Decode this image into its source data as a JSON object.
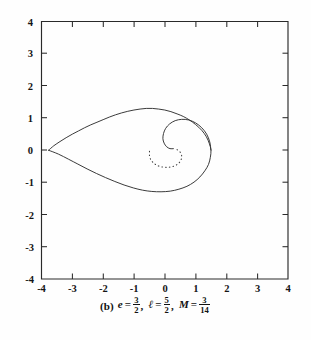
{
  "figure": {
    "panel_label": "(b)",
    "caption_terms": [
      {
        "symbol": "e",
        "relation": "=",
        "numerator": "3",
        "denominator": "2"
      },
      {
        "symbol": "ℓ",
        "relation": "=",
        "numerator": "5",
        "denominator": "2"
      },
      {
        "symbol": "M",
        "relation": "=",
        "numerator": "3",
        "denominator": "14"
      }
    ],
    "caption_plain": "(b) e = 3/2, ℓ = 5/2, M = 3/14",
    "separator": ","
  },
  "chart_data": {
    "type": "line",
    "title": "",
    "subtitle": "",
    "xlabel": "",
    "ylabel": "",
    "xlim": [
      -4,
      4
    ],
    "ylim": [
      -4,
      4
    ],
    "grid": false,
    "legend": null,
    "legend_position": "none",
    "x_ticks": [
      -4,
      -3,
      -2,
      -1,
      0,
      1,
      2,
      3,
      4
    ],
    "x_tick_labels": [
      "-4",
      "-3",
      "-2",
      "-1",
      "0",
      "1",
      "2",
      "3",
      "4"
    ],
    "y_ticks": [
      -4,
      -3,
      -2,
      -1,
      0,
      1,
      2,
      3,
      4
    ],
    "y_tick_labels": [
      "-4",
      "-3",
      "-2",
      "-1",
      "0",
      "1",
      "2",
      "3",
      "4"
    ],
    "series": [
      {
        "name": "orbit-solid",
        "style": "solid",
        "color": "#303030",
        "description": "Teardrop-shaped relativistic orbit with self-intersection near x = -3.75, y = 0, spiralling inward clockwise toward the centre near x = 0.1, y = 0.05",
        "points": [
          [
            -3.77,
            0.0
          ],
          [
            -3.6,
            0.14
          ],
          [
            -3.4,
            0.27
          ],
          [
            -3.2,
            0.39
          ],
          [
            -3.0,
            0.5
          ],
          [
            -2.8,
            0.6
          ],
          [
            -2.6,
            0.7
          ],
          [
            -2.4,
            0.79
          ],
          [
            -2.2,
            0.87
          ],
          [
            -2.0,
            0.95
          ],
          [
            -1.8,
            1.03
          ],
          [
            -1.6,
            1.1
          ],
          [
            -1.4,
            1.16
          ],
          [
            -1.2,
            1.21
          ],
          [
            -1.0,
            1.25
          ],
          [
            -0.8,
            1.28
          ],
          [
            -0.6,
            1.3
          ],
          [
            -0.4,
            1.3
          ],
          [
            -0.2,
            1.28
          ],
          [
            0.0,
            1.25
          ],
          [
            0.2,
            1.2
          ],
          [
            0.4,
            1.13
          ],
          [
            0.6,
            1.05
          ],
          [
            0.8,
            0.94
          ],
          [
            1.0,
            0.8
          ],
          [
            1.2,
            0.62
          ],
          [
            1.35,
            0.42
          ],
          [
            1.45,
            0.2
          ],
          [
            1.5,
            0.0
          ],
          [
            1.48,
            -0.22
          ],
          [
            1.42,
            -0.44
          ],
          [
            1.3,
            -0.64
          ],
          [
            1.14,
            -0.83
          ],
          [
            0.95,
            -0.99
          ],
          [
            0.72,
            -1.12
          ],
          [
            0.46,
            -1.21
          ],
          [
            0.18,
            -1.27
          ],
          [
            -0.12,
            -1.29
          ],
          [
            -0.42,
            -1.28
          ],
          [
            -0.72,
            -1.24
          ],
          [
            -1.02,
            -1.17
          ],
          [
            -1.32,
            -1.08
          ],
          [
            -1.62,
            -0.97
          ],
          [
            -1.92,
            -0.85
          ],
          [
            -2.22,
            -0.72
          ],
          [
            -2.52,
            -0.58
          ],
          [
            -2.82,
            -0.43
          ],
          [
            -3.12,
            -0.28
          ],
          [
            -3.45,
            -0.12
          ],
          [
            -3.77,
            0.0
          ]
        ],
        "spiral_points": [
          [
            1.5,
            0.0
          ],
          [
            1.46,
            0.26
          ],
          [
            1.36,
            0.5
          ],
          [
            1.2,
            0.7
          ],
          [
            1.0,
            0.85
          ],
          [
            0.78,
            0.94
          ],
          [
            0.55,
            0.96
          ],
          [
            0.34,
            0.92
          ],
          [
            0.16,
            0.82
          ],
          [
            0.03,
            0.68
          ],
          [
            -0.04,
            0.52
          ],
          [
            -0.06,
            0.36
          ],
          [
            -0.02,
            0.22
          ],
          [
            0.06,
            0.11
          ],
          [
            0.17,
            0.05
          ],
          [
            0.28,
            0.05
          ]
        ]
      },
      {
        "name": "orbit-dotted-tail",
        "style": "dotted",
        "color": "#3a3a3a",
        "description": "Dotted inner arc of the orbit beneath the spiral centre",
        "points": [
          [
            0.4,
            0.02
          ],
          [
            0.5,
            -0.06
          ],
          [
            0.55,
            -0.18
          ],
          [
            0.52,
            -0.32
          ],
          [
            0.42,
            -0.43
          ],
          [
            0.28,
            -0.5
          ],
          [
            0.1,
            -0.53
          ],
          [
            -0.08,
            -0.52
          ],
          [
            -0.25,
            -0.47
          ],
          [
            -0.38,
            -0.38
          ],
          [
            -0.47,
            -0.26
          ],
          [
            -0.5,
            -0.12
          ],
          [
            -0.49,
            0.0
          ]
        ]
      }
    ]
  }
}
